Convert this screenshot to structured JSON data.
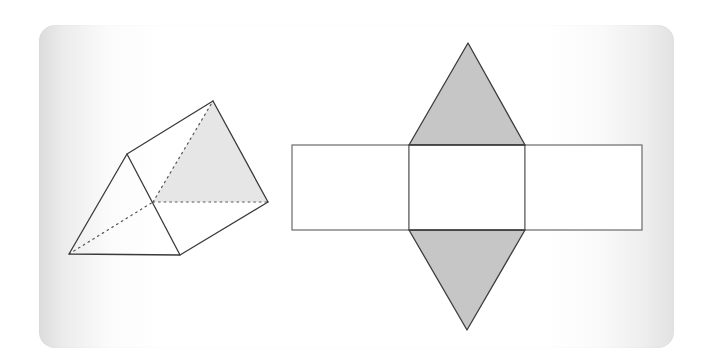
{
  "figure": {
    "colors": {
      "background": "#ffffff",
      "frame_edge_gradient": "#dcdcdc",
      "line": "#3a3a3a",
      "prism_shaded_face": "#e6e6e6",
      "net_triangle_fill": "#c6c6c6",
      "net_rectangle_fill": "#ffffff"
    },
    "prism": {
      "front_face": {
        "bottom_left": [
          69,
          254
        ],
        "top": [
          127,
          154
        ],
        "bottom_right": [
          180,
          255
        ]
      },
      "back_face": {
        "top": [
          213,
          101
        ],
        "bottom_right": [
          268,
          202
        ],
        "bottom_left_hidden": [
          153,
          202
        ]
      },
      "shaded_face": "back"
    },
    "net": {
      "rectangles": [
        {
          "name": "left-face",
          "x": 292,
          "y": 145,
          "width": 117,
          "height": 85
        },
        {
          "name": "middle-face",
          "x": 409,
          "y": 145,
          "width": 116,
          "height": 85
        },
        {
          "name": "right-face",
          "x": 525,
          "y": 145,
          "width": 117,
          "height": 85
        }
      ],
      "triangles": [
        {
          "name": "top-base",
          "points": [
            [
              409,
              145
            ],
            [
              468,
              43
            ],
            [
              525,
              145
            ]
          ]
        },
        {
          "name": "bottom-base",
          "points": [
            [
              409,
              230
            ],
            [
              467,
              330
            ],
            [
              525,
              230
            ]
          ]
        }
      ]
    }
  }
}
